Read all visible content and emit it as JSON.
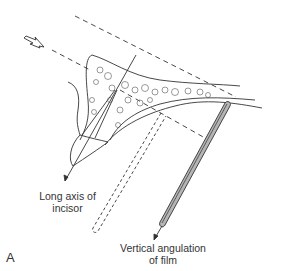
{
  "figure": {
    "panel_letter": "A",
    "labels": {
      "incisor_axis": [
        "Long axis of",
        "incisor"
      ],
      "film_angulation": [
        "Vertical angulation",
        "of film"
      ]
    },
    "elements": [
      "x-ray beam direction arrow",
      "central ray dashed lines",
      "maxillary incisor with alveolar bone",
      "long axis of incisor line",
      "palate outline",
      "film position (dashed, ideal parallel)",
      "film position (solid, bisecting)",
      "film angulation line"
    ],
    "colors": {
      "line": "#333333",
      "film_fill": "#b5b5b5",
      "background": "#ffffff"
    }
  }
}
